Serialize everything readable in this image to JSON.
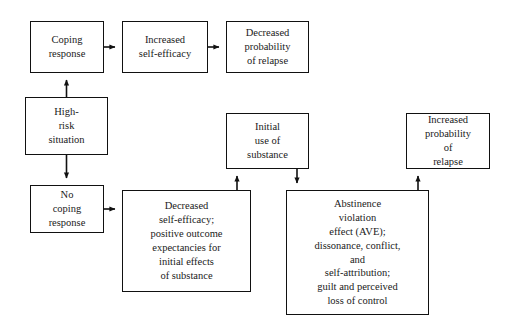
{
  "diagram": {
    "background_color": "#ffffff",
    "line_color": "#111111",
    "text_color": "#1a1a1a",
    "nodes": {
      "coping_response": "Coping\nresponse",
      "increased_self_efficacy": "Increased\nself-efficacy",
      "decreased_probability_of_relapse": "Decreased\nprobability\nof relapse",
      "high_risk_situation": "High-\nrisk\nsituation",
      "no_coping_response": "No\ncoping\nresponse",
      "decreased_self_efficacy": "Decreased\nself-efficacy;\npositive outcome\nexpectancies for\ninitial effects\nof substance",
      "initial_use_of_substance": "Initial\nuse of\nsubstance",
      "abstinence_violation_effect": "Abstinence\nviolation\neffect (AVE);\ndissonance, conflict,\nand\nself-attribution;\nguilt and perceived\nloss of control",
      "increased_probability_of_relapse": "Increased\nprobability\nof\nrelapse"
    },
    "edges": [
      {
        "from": "high_risk_situation",
        "to": "coping_response",
        "direction": "up"
      },
      {
        "from": "coping_response",
        "to": "increased_self_efficacy",
        "direction": "right"
      },
      {
        "from": "increased_self_efficacy",
        "to": "decreased_probability_of_relapse",
        "direction": "right"
      },
      {
        "from": "high_risk_situation",
        "to": "no_coping_response",
        "direction": "down"
      },
      {
        "from": "no_coping_response",
        "to": "decreased_self_efficacy",
        "direction": "right"
      },
      {
        "from": "decreased_self_efficacy",
        "to": "initial_use_of_substance",
        "direction": "up"
      },
      {
        "from": "initial_use_of_substance",
        "to": "abstinence_violation_effect",
        "direction": "down"
      },
      {
        "from": "abstinence_violation_effect",
        "to": "increased_probability_of_relapse",
        "direction": "up"
      }
    ]
  }
}
